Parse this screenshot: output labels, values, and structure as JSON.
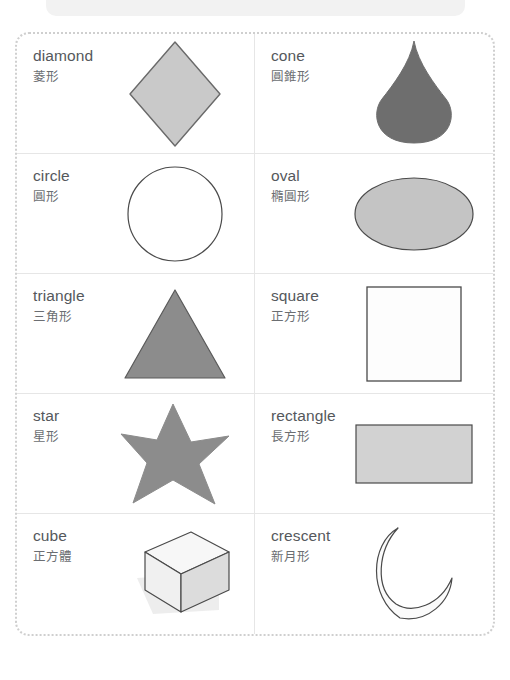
{
  "page": {
    "background_color": "#ffffff",
    "banner_color": "#f2f2f2",
    "frame_border_color": "#cfcfcf",
    "grid_line_color": "#e6e6e6",
    "label_en_color": "#55585c",
    "label_zh_color": "#6b6e72"
  },
  "cards": [
    {
      "id": "diamond",
      "label_en": "diamond",
      "label_zh": "菱形",
      "icon": "diamond-shape",
      "fill": "#c9c9c9",
      "stroke": "#6a6a6a"
    },
    {
      "id": "cone",
      "label_en": "cone",
      "label_zh": "圓錐形",
      "icon": "cone-shape",
      "fill": "#6e6e6e",
      "stroke": "#6e6e6e"
    },
    {
      "id": "circle",
      "label_en": "circle",
      "label_zh": "圓形",
      "icon": "circle-shape",
      "fill": "#ffffff",
      "stroke": "#4a4a4a"
    },
    {
      "id": "oval",
      "label_en": "oval",
      "label_zh": "橢圓形",
      "icon": "oval-shape",
      "fill": "#c4c4c4",
      "stroke": "#4a4a4a"
    },
    {
      "id": "triangle",
      "label_en": "triangle",
      "label_zh": "三角形",
      "icon": "triangle-shape",
      "fill": "#8c8c8c",
      "stroke": "#5a5a5a"
    },
    {
      "id": "square",
      "label_en": "square",
      "label_zh": "正方形",
      "icon": "square-shape",
      "fill": "#fdfdfd",
      "stroke": "#4a4a4a"
    },
    {
      "id": "star",
      "label_en": "star",
      "label_zh": "星形",
      "icon": "star-shape",
      "fill": "#8c8c8c",
      "stroke": "#8c8c8c"
    },
    {
      "id": "rectangle",
      "label_en": "rectangle",
      "label_zh": "長方形",
      "icon": "rectangle-shape",
      "fill": "#d2d2d2",
      "stroke": "#4a4a4a"
    },
    {
      "id": "cube",
      "label_en": "cube",
      "label_zh": "正方體",
      "icon": "cube-shape",
      "fill": "#f4f4f4",
      "stroke": "#4a4a4a"
    },
    {
      "id": "crescent",
      "label_en": "crescent",
      "label_zh": "新月形",
      "icon": "crescent-shape",
      "fill": "#fbfbfb",
      "stroke": "#4a4a4a"
    }
  ]
}
